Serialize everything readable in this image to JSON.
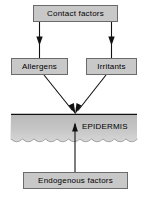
{
  "diagram": {
    "canvas": {
      "width": 151,
      "height": 201,
      "background": "#ffffff"
    },
    "style": {
      "box_fill": "#c8c8c8",
      "box_border": "#6b6b6b",
      "band_fill_top": "#bdbdbd",
      "band_fill_bottom": "#d2d2d2",
      "line_color": "#111111",
      "text_color": "#000000"
    },
    "nodes": [
      {
        "id": "contact-factors",
        "label": "Contact factors",
        "shape": "rectangle",
        "x": 33,
        "y": 5,
        "width": 85,
        "height": 17
      },
      {
        "id": "allergens",
        "label": "Allergens",
        "shape": "rectangle",
        "x": 11,
        "y": 58,
        "width": 57,
        "height": 17
      },
      {
        "id": "irritants",
        "label": "Irritants",
        "shape": "rectangle",
        "x": 86,
        "y": 58,
        "width": 51,
        "height": 17
      },
      {
        "id": "endogenous-factors",
        "label": "Endogenous factors",
        "shape": "rectangle",
        "x": 23,
        "y": 172,
        "width": 105,
        "height": 17
      }
    ],
    "band": {
      "id": "epidermis",
      "label": "EPIDERMIS",
      "label_x": 82,
      "label_y": 126,
      "x": 11,
      "y": 114,
      "width": 126,
      "height": 31,
      "bottom_edge": "wavy",
      "wave_count": 11
    },
    "edges": [
      {
        "id": "contact-to-allergens",
        "from": "contact-factors",
        "to": "allergens",
        "arrowhead": "down"
      },
      {
        "id": "contact-to-irritants",
        "from": "contact-factors",
        "to": "irritants",
        "arrowhead": "down"
      },
      {
        "id": "allergens-to-epidermis",
        "from": "allergens",
        "to": "epidermis",
        "arrowhead": "down-right-diagonal"
      },
      {
        "id": "irritants-to-epidermis",
        "from": "irritants",
        "to": "epidermis",
        "arrowhead": "down-left-diagonal"
      },
      {
        "id": "endogenous-to-epidermis",
        "from": "endogenous-factors",
        "to": "epidermis",
        "arrowhead": "up"
      }
    ]
  }
}
